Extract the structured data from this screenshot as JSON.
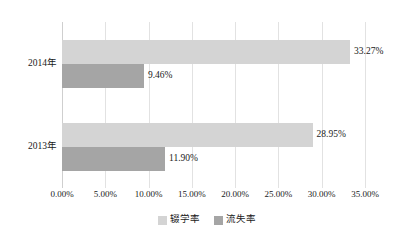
{
  "chart_data": {
    "type": "bar",
    "orientation": "horizontal",
    "title": "",
    "subtitle": "",
    "xlabel": "",
    "ylabel": "",
    "categories": [
      "2014年",
      "2013年"
    ],
    "series": [
      {
        "name": "辍学率",
        "color": "#d4d4d4",
        "values": [
          33.27,
          28.95
        ],
        "labels": [
          "33.27%",
          "28.95%"
        ]
      },
      {
        "name": "流失率",
        "color": "#a5a5a5",
        "values": [
          9.46,
          11.9
        ],
        "labels": [
          "9.46%",
          "11.90%"
        ]
      }
    ],
    "xlim": [
      0,
      35
    ],
    "xticks": [
      0,
      5,
      10,
      15,
      20,
      25,
      30,
      35
    ],
    "xtick_labels": [
      "0.00%",
      "5.00%",
      "10.00%",
      "15.00%",
      "20.00%",
      "25.00%",
      "30.00%",
      "35.00%"
    ],
    "grid": true,
    "grid_axis": "x",
    "legend_position": "bottom",
    "background": "#ffffff",
    "gridline_color": "#e2e2e2"
  }
}
